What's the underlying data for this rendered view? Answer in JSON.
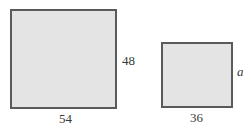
{
  "figure": {
    "large_rectangle": {
      "width_label": "54",
      "height_label": "48"
    },
    "small_rectangle": {
      "width_label": "36",
      "height_label": "a"
    }
  }
}
